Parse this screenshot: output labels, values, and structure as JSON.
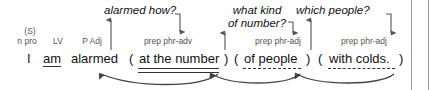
{
  "figure": {
    "sentence": "I am alarmed ( at the number ) ( of people ) ( with colds. )",
    "colors": {
      "text": "#111111",
      "label": "#555555",
      "connector": "#555555",
      "rule": "#9a9a9a"
    }
  },
  "questions": [
    {
      "id": "q-alarmed-how",
      "text": "alarmed how?"
    },
    {
      "id": "q-what-kind",
      "line1": "what kind",
      "line2": "of number?"
    },
    {
      "id": "q-which-people",
      "text": "which people?"
    }
  ],
  "clause": {
    "subject": {
      "marker": "(S)",
      "label": "n pro",
      "word": "I"
    },
    "verb": {
      "label": "LV",
      "word": "am"
    },
    "complement": {
      "label": "P Adj",
      "word": "alarmed"
    }
  },
  "phrases": [
    {
      "id": "phrase-at-the-number",
      "label": "prep phr-adv",
      "open_paren": "(",
      "text": "at the number",
      "close_paren": ")",
      "underline": "double"
    },
    {
      "id": "phrase-of-people",
      "label": "prep phr-adj",
      "open_paren": "(",
      "text": "of people",
      "close_paren": ")",
      "underline": "dashed"
    },
    {
      "id": "phrase-with-colds",
      "label": "prep phr-adj",
      "open_paren": "(",
      "text": "with colds.",
      "close_paren": ")",
      "underline": "dashed"
    }
  ]
}
